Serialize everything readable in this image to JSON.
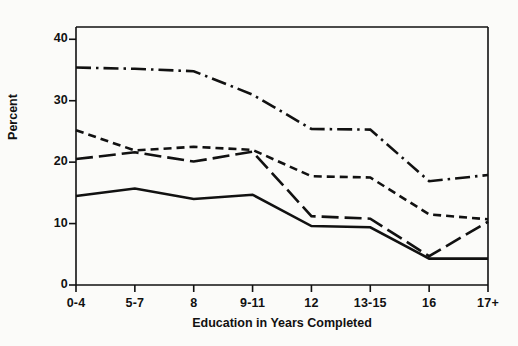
{
  "chart_data": {
    "type": "line",
    "title": "",
    "xlabel": "Education in Years Completed",
    "ylabel": "Percent",
    "categories": [
      "0-4",
      "5-7",
      "8",
      "9-11",
      "12",
      "13-15",
      "16",
      "17+"
    ],
    "ylim": [
      0,
      42
    ],
    "xlim": [
      0,
      7
    ],
    "yticks": [
      0,
      10,
      20,
      30,
      40
    ],
    "ytick_labels": [
      "0",
      "10",
      "20",
      "30",
      "40"
    ],
    "grid": false,
    "legend": "none",
    "frame": "top and right spines drawn; left and bottom axes with outward ticks",
    "series": [
      {
        "name": "series-solid",
        "style": "solid",
        "values": [
          14.5,
          15.7,
          14.0,
          14.7,
          9.6,
          9.4,
          4.3,
          4.3
        ]
      },
      {
        "name": "series-long-dash",
        "style": "long-dash",
        "values": [
          20.5,
          21.6,
          20.1,
          21.7,
          11.2,
          10.8,
          4.7,
          10.3
        ]
      },
      {
        "name": "series-short-dash",
        "style": "short-dash",
        "values": [
          25.2,
          21.9,
          22.5,
          22.0,
          17.7,
          17.5,
          11.5,
          10.7
        ]
      },
      {
        "name": "series-dash-dot",
        "style": "dash-dot",
        "values": [
          35.4,
          35.2,
          34.8,
          31.0,
          25.4,
          25.3,
          16.9,
          17.9
        ]
      }
    ],
    "colors": {
      "ink": "#111111",
      "background": "#fbfbf9"
    }
  }
}
